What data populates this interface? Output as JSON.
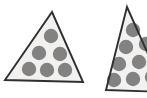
{
  "image": {
    "width": 147,
    "height": 98,
    "background_color": "#ffffff",
    "description": "Two triangles containing gray dots; the right triangle is clipped by the right edge of the image"
  },
  "style": {
    "triangle_fill": "#f2f1f0",
    "triangle_stroke": "#2f2f2f",
    "stroke_width": 1.9,
    "dot_color": "#828282"
  },
  "shapes": [
    {
      "name": "left-triangle",
      "type": "triangle",
      "clipped": false,
      "dot_count": 6,
      "points": "52,12 83,82 5,80",
      "dots": [
        {
          "cx": 51,
          "cy": 36,
          "r": 7.2
        },
        {
          "cx": 39,
          "cy": 53,
          "r": 7.2
        },
        {
          "cx": 60,
          "cy": 54,
          "r": 7.2
        },
        {
          "cx": 29,
          "cy": 69,
          "r": 7.2
        },
        {
          "cx": 47,
          "cy": 70,
          "r": 7.2
        },
        {
          "cx": 65,
          "cy": 70,
          "r": 7.2
        }
      ]
    },
    {
      "name": "right-triangle",
      "type": "triangle",
      "clipped": true,
      "dot_count": 9,
      "points": "127,7 165,92 106,90",
      "dots": [
        {
          "cx": 133,
          "cy": 30,
          "r": 7.2
        },
        {
          "cx": 126,
          "cy": 47,
          "r": 7.2
        },
        {
          "cx": 146,
          "cy": 44,
          "r": 7.2
        },
        {
          "cx": 119,
          "cy": 64,
          "r": 7.2
        },
        {
          "cx": 139,
          "cy": 62,
          "r": 7.2
        },
        {
          "cx": 158,
          "cy": 60,
          "r": 7.2
        },
        {
          "cx": 114,
          "cy": 80,
          "r": 7.2
        },
        {
          "cx": 133,
          "cy": 79,
          "r": 7.2
        },
        {
          "cx": 152,
          "cy": 77,
          "r": 7.2
        }
      ]
    }
  ]
}
